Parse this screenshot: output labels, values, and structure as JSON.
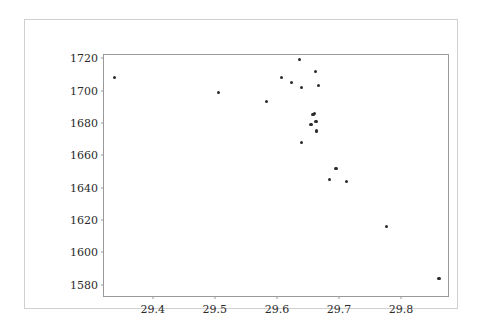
{
  "chart_data": {
    "type": "scatter",
    "title": "",
    "xlabel": "",
    "ylabel": "",
    "grid": false,
    "legend": null,
    "marker": {
      "shape": "circle",
      "color": "#2b2b2b",
      "size_px": 3.2
    },
    "xlim": [
      29.3215,
      29.8755
    ],
    "ylim": [
      1573.0,
      1722.0
    ],
    "xticks": [
      29.4,
      29.5,
      29.6,
      29.7,
      29.8
    ],
    "xtick_labels": [
      "29.4",
      "29.5",
      "29.6",
      "29.7",
      "29.8"
    ],
    "yticks": [
      1580,
      1600,
      1620,
      1640,
      1660,
      1680,
      1700,
      1720
    ],
    "ytick_labels": [
      "1580",
      "1600",
      "1620",
      "1640",
      "1660",
      "1680",
      "1700",
      "1720"
    ],
    "n_points": 21,
    "points": [
      {
        "x": 29.339,
        "y": 1708
      },
      {
        "x": 29.506,
        "y": 1699
      },
      {
        "x": 29.583,
        "y": 1693
      },
      {
        "x": 29.608,
        "y": 1708
      },
      {
        "x": 29.624,
        "y": 1705
      },
      {
        "x": 29.637,
        "y": 1719
      },
      {
        "x": 29.639,
        "y": 1702
      },
      {
        "x": 29.64,
        "y": 1668
      },
      {
        "x": 29.655,
        "y": 1679
      },
      {
        "x": 29.658,
        "y": 1685
      },
      {
        "x": 29.66,
        "y": 1686
      },
      {
        "x": 29.662,
        "y": 1712
      },
      {
        "x": 29.663,
        "y": 1681
      },
      {
        "x": 29.664,
        "y": 1675
      },
      {
        "x": 29.667,
        "y": 1703
      },
      {
        "x": 29.685,
        "y": 1645
      },
      {
        "x": 29.695,
        "y": 1652
      },
      {
        "x": 29.712,
        "y": 1644
      },
      {
        "x": 29.777,
        "y": 1616
      },
      {
        "x": 29.861,
        "y": 1584
      }
    ]
  }
}
